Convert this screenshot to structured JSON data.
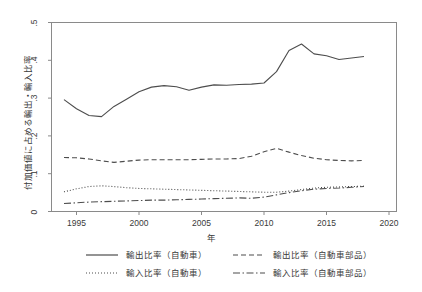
{
  "chart_data": {
    "type": "line",
    "title": "",
    "xlabel": "年",
    "ylabel": "付加価値に占める輸出・輸入比率",
    "xlim": [
      1993.0,
      2020.6
    ],
    "ylim": [
      0,
      0.5
    ],
    "grid": false,
    "legend_position": "below-plot",
    "xticks": [
      "1995",
      "2000",
      "2005",
      "2010",
      "2015",
      "2020"
    ],
    "xtick_values": [
      1995,
      2000,
      2005,
      2010,
      2015,
      2020
    ],
    "yticks": [
      "0",
      ".1",
      ".2",
      ".3",
      ".4",
      ".5"
    ],
    "ytick_values": [
      0,
      0.1,
      0.2,
      0.3,
      0.4,
      0.5
    ],
    "x": [
      1994,
      1995,
      1996,
      1997,
      1998,
      1999,
      2000,
      2001,
      2002,
      2003,
      2004,
      2005,
      2006,
      2007,
      2008,
      2009,
      2010,
      2011,
      2012,
      2013,
      2014,
      2015,
      2016,
      2017,
      2018
    ],
    "series": [
      {
        "name": "輸出比率（自動車）",
        "style": "solid",
        "color": "#4d4d4d",
        "values": [
          0.296,
          0.272,
          0.254,
          0.251,
          0.278,
          0.297,
          0.317,
          0.329,
          0.333,
          0.33,
          0.321,
          0.329,
          0.335,
          0.334,
          0.336,
          0.337,
          0.34,
          0.37,
          0.426,
          0.443,
          0.417,
          0.412,
          0.402,
          0.406,
          0.41
        ]
      },
      {
        "name": "輸入比率（自動車）",
        "style": "dotted",
        "color": "#4d4d4d",
        "values": [
          0.052,
          0.06,
          0.066,
          0.068,
          0.066,
          0.063,
          0.061,
          0.06,
          0.059,
          0.058,
          0.057,
          0.056,
          0.055,
          0.054,
          0.053,
          0.052,
          0.051,
          0.051,
          0.054,
          0.058,
          0.062,
          0.064,
          0.065,
          0.066,
          0.067
        ]
      },
      {
        "name": "輸出比率（自動車部品）",
        "style": "dashed",
        "color": "#4d4d4d",
        "values": [
          0.143,
          0.142,
          0.139,
          0.134,
          0.13,
          0.133,
          0.136,
          0.137,
          0.137,
          0.137,
          0.137,
          0.138,
          0.139,
          0.139,
          0.14,
          0.146,
          0.158,
          0.167,
          0.157,
          0.148,
          0.141,
          0.137,
          0.135,
          0.134,
          0.135
        ]
      },
      {
        "name": "輸入比率（自動車部品）",
        "style": "dashdot",
        "color": "#4d4d4d",
        "values": [
          0.021,
          0.023,
          0.025,
          0.026,
          0.027,
          0.028,
          0.029,
          0.03,
          0.03,
          0.031,
          0.032,
          0.033,
          0.034,
          0.035,
          0.036,
          0.035,
          0.038,
          0.044,
          0.05,
          0.055,
          0.059,
          0.061,
          0.062,
          0.064,
          0.066
        ]
      }
    ]
  },
  "legend": {
    "entries": [
      {
        "label": "輸出比率（自動車）",
        "style": "solid"
      },
      {
        "label": "輸入比率（自動車）",
        "style": "dotted"
      },
      {
        "label": "輸出比率（自動車部品）",
        "style": "dashed"
      },
      {
        "label": "輸入比率（自動車部品）",
        "style": "dashdot"
      }
    ]
  }
}
